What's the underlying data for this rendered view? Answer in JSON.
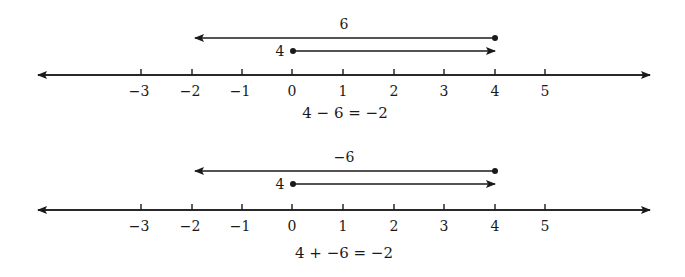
{
  "diagram": {
    "type": "number-line-diagrams",
    "tick_values": [
      -3,
      -2,
      -1,
      0,
      1,
      2,
      3,
      4,
      5
    ],
    "tick_labels": [
      "−3",
      "−2",
      "−1",
      "0",
      "1",
      "2",
      "3",
      "4",
      "5"
    ],
    "panels": [
      {
        "long_arrow_label": "6",
        "long_arrow": {
          "from": 4,
          "to": -2
        },
        "short_arrow_label": "4",
        "short_arrow": {
          "from": 0,
          "to": 4
        },
        "equation": "4 − 6 = −2"
      },
      {
        "long_arrow_label": "−6",
        "long_arrow": {
          "from": 4,
          "to": -2
        },
        "short_arrow_label": "4",
        "short_arrow": {
          "from": 0,
          "to": 4
        },
        "equation": "4 + −6 = −2"
      }
    ]
  }
}
